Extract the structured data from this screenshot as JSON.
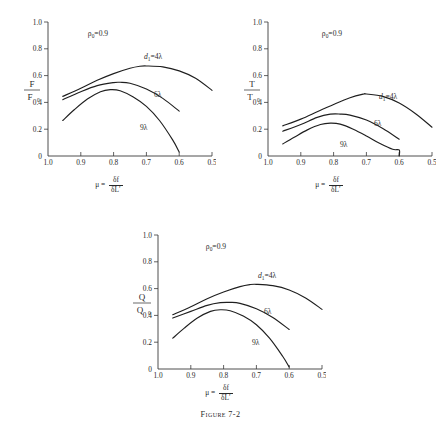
{
  "figure": {
    "caption_label": "Figure",
    "caption_number": "7-2",
    "background": "#ffffff",
    "ink_color": "#1f1f1f"
  },
  "axis": {
    "x_ticks": [
      "1.0",
      "0.9",
      "0.8",
      "0.7",
      "0.6",
      "0.5"
    ],
    "x_values": [
      1.0,
      0.9,
      0.8,
      0.7,
      0.6,
      0.5
    ],
    "y_ticks": [
      "0",
      "0.2",
      "0.4",
      "0.6",
      "0.8",
      "1.0"
    ],
    "y_values": [
      0,
      0.2,
      0.4,
      0.6,
      0.8,
      1.0
    ],
    "xlabel_symbol": "μ",
    "xlabel_equals": "=",
    "xlabel_numerator": "δf",
    "xlabel_denominator": "δL′"
  },
  "annotations": {
    "rho_symbol": "ρ",
    "rho_subscript": "0",
    "rho_value": "=0.9",
    "series_label_lead": "d",
    "series_label_lead_sub": "1",
    "series_label_lead_value": "=4λ",
    "series_label_mid": "6λ",
    "series_label_low": "9λ"
  },
  "chart_data": [
    {
      "type": "line",
      "title": "",
      "id": "F-over-F0",
      "ylabel_numerator": "F",
      "ylabel_denominator": "F",
      "ylabel_denominator_sub": "0",
      "xlabel": "μ = δf/δL′",
      "xlim": [
        1.0,
        0.5
      ],
      "ylim": [
        0,
        1.0
      ],
      "x_reversed": true,
      "grid": false,
      "legend": "inline-labels",
      "annotation": "ρ₀=0.9",
      "series": [
        {
          "name": "d₁=4λ",
          "x": [
            0.955,
            0.9,
            0.85,
            0.8,
            0.75,
            0.72,
            0.7,
            0.65,
            0.6,
            0.55,
            0.5
          ],
          "values": [
            0.445,
            0.505,
            0.565,
            0.615,
            0.655,
            0.67,
            0.672,
            0.665,
            0.635,
            0.58,
            0.49
          ]
        },
        {
          "name": "6λ",
          "x": [
            0.955,
            0.9,
            0.85,
            0.8,
            0.78,
            0.75,
            0.7,
            0.65,
            0.6
          ],
          "values": [
            0.42,
            0.48,
            0.525,
            0.548,
            0.55,
            0.543,
            0.5,
            0.43,
            0.335
          ]
        },
        {
          "name": "9λ",
          "x": [
            0.955,
            0.92,
            0.88,
            0.84,
            0.81,
            0.78,
            0.74,
            0.7,
            0.66,
            0.62,
            0.6
          ],
          "values": [
            0.265,
            0.345,
            0.425,
            0.48,
            0.495,
            0.487,
            0.44,
            0.37,
            0.265,
            0.12,
            0.03
          ]
        }
      ]
    },
    {
      "type": "line",
      "title": "",
      "id": "T-over-T0",
      "ylabel_numerator": "T",
      "ylabel_denominator": "T",
      "ylabel_denominator_sub": "0",
      "xlabel": "μ = δf/δL′",
      "xlim": [
        1.0,
        0.5
      ],
      "ylim": [
        0,
        1.0
      ],
      "x_reversed": true,
      "grid": false,
      "legend": "inline-labels",
      "annotation": "ρ₀=0.9",
      "series": [
        {
          "name": "d₁=4λ",
          "x": [
            0.955,
            0.9,
            0.85,
            0.8,
            0.75,
            0.71,
            0.7,
            0.65,
            0.6,
            0.55,
            0.5
          ],
          "values": [
            0.225,
            0.275,
            0.33,
            0.385,
            0.435,
            0.462,
            0.463,
            0.445,
            0.395,
            0.315,
            0.215
          ]
        },
        {
          "name": "6λ",
          "x": [
            0.955,
            0.9,
            0.85,
            0.81,
            0.78,
            0.75,
            0.7,
            0.65,
            0.6
          ],
          "values": [
            0.185,
            0.235,
            0.288,
            0.312,
            0.313,
            0.305,
            0.268,
            0.205,
            0.125
          ]
        },
        {
          "name": "9λ",
          "x": [
            0.955,
            0.92,
            0.88,
            0.84,
            0.81,
            0.78,
            0.74,
            0.7,
            0.66,
            0.62,
            0.6,
            0.6
          ],
          "values": [
            0.09,
            0.14,
            0.195,
            0.235,
            0.245,
            0.238,
            0.2,
            0.15,
            0.095,
            0.05,
            0.045,
            0.0
          ]
        }
      ]
    },
    {
      "type": "line",
      "title": "",
      "id": "Q-over-Q0",
      "ylabel_numerator": "Q",
      "ylabel_denominator": "Q",
      "ylabel_denominator_sub": "0",
      "xlabel": "μ = δf/δL′",
      "xlim": [
        1.0,
        0.5
      ],
      "ylim": [
        0,
        1.0
      ],
      "x_reversed": true,
      "grid": false,
      "legend": "inline-labels",
      "annotation": "ρ₀=0.9",
      "series": [
        {
          "name": "d₁=4λ",
          "x": [
            0.955,
            0.9,
            0.85,
            0.8,
            0.75,
            0.72,
            0.7,
            0.65,
            0.6,
            0.55,
            0.5
          ],
          "values": [
            0.405,
            0.465,
            0.525,
            0.575,
            0.615,
            0.63,
            0.632,
            0.622,
            0.59,
            0.53,
            0.445
          ]
        },
        {
          "name": "6λ",
          "x": [
            0.955,
            0.9,
            0.85,
            0.81,
            0.78,
            0.75,
            0.7,
            0.65,
            0.6
          ],
          "values": [
            0.38,
            0.43,
            0.475,
            0.495,
            0.497,
            0.49,
            0.45,
            0.385,
            0.295
          ]
        },
        {
          "name": "9λ",
          "x": [
            0.955,
            0.92,
            0.88,
            0.84,
            0.81,
            0.78,
            0.74,
            0.7,
            0.66,
            0.62,
            0.6
          ],
          "values": [
            0.23,
            0.305,
            0.38,
            0.43,
            0.442,
            0.435,
            0.395,
            0.33,
            0.23,
            0.095,
            0.015
          ]
        }
      ]
    }
  ]
}
